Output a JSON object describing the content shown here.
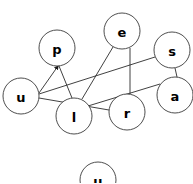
{
  "diagram": {
    "canvas": {
      "width": 193,
      "height": 183,
      "background": "#ffffff"
    },
    "style": {
      "node_fill": "#ffffff",
      "node_stroke": "#3a3a3a",
      "edge_stroke": "#2b2b2b",
      "label_color": "#000000",
      "node_radius": 18
    },
    "nodes": [
      {
        "id": "u1",
        "label": "u",
        "cx": 21,
        "cy": 96,
        "r": 18
      },
      {
        "id": "p",
        "label": "p",
        "cx": 57,
        "cy": 48,
        "r": 18
      },
      {
        "id": "e",
        "label": "e",
        "cx": 122,
        "cy": 31,
        "r": 18
      },
      {
        "id": "s",
        "label": "s",
        "cx": 172,
        "cy": 50,
        "r": 18
      },
      {
        "id": "a",
        "label": "a",
        "cx": 175,
        "cy": 95,
        "r": 18
      },
      {
        "id": "l",
        "label": "l",
        "cx": 74,
        "cy": 116,
        "r": 18
      },
      {
        "id": "r",
        "label": "r",
        "cx": 127,
        "cy": 112,
        "r": 18
      },
      {
        "id": "u2",
        "label": "u",
        "cx": 98,
        "cy": 180,
        "r": 18
      }
    ],
    "edges": [
      {
        "id": "e-u1-p",
        "from": "u1",
        "to": "p",
        "directed": true,
        "x1": 39,
        "y1": 93,
        "x2": 59,
        "y2": 67
      },
      {
        "id": "e-u1-s",
        "from": "u1",
        "to": "s",
        "directed": false,
        "x1": 39,
        "y1": 94,
        "x2": 155,
        "y2": 57
      },
      {
        "id": "e-u1-r",
        "from": "u1",
        "to": "r",
        "directed": false,
        "x1": 39,
        "y1": 98,
        "x2": 109,
        "y2": 110
      },
      {
        "id": "e-p-l",
        "from": "p",
        "to": "l",
        "directed": false,
        "x1": 59,
        "y1": 66,
        "x2": 72,
        "y2": 98
      },
      {
        "id": "e-e-l",
        "from": "e",
        "to": "l",
        "directed": false,
        "x1": 113,
        "y1": 47,
        "x2": 82,
        "y2": 99
      },
      {
        "id": "e-e-r",
        "from": "e",
        "to": "r",
        "directed": false,
        "x1": 130,
        "y1": 48,
        "x2": 130,
        "y2": 94
      },
      {
        "id": "e-s-a",
        "from": "s",
        "to": "a",
        "directed": false,
        "x1": 175,
        "y1": 68,
        "x2": 177,
        "y2": 77
      },
      {
        "id": "e-l-a",
        "from": "l",
        "to": "a",
        "directed": false,
        "x1": 88,
        "y1": 106,
        "x2": 160,
        "y2": 84
      }
    ]
  }
}
